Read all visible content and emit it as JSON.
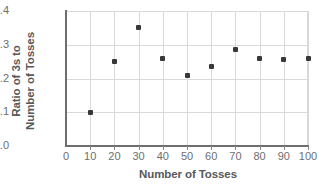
{
  "chart_data": {
    "type": "scatter",
    "title": "",
    "xlabel": "Number of Tosses",
    "ylabel_line1": "Ratio of 3s to",
    "ylabel_line2": "Number of Tosses",
    "x": [
      10,
      20,
      30,
      40,
      50,
      60,
      70,
      80,
      90,
      100
    ],
    "values": [
      0.1,
      0.25,
      0.35,
      0.26,
      0.21,
      0.235,
      0.285,
      0.26,
      0.255,
      0.26
    ],
    "xlim": [
      0,
      100
    ],
    "ylim": [
      0.0,
      0.4
    ],
    "xticks": [
      "0",
      "10",
      "20",
      "30",
      "40",
      "50",
      "60",
      "70",
      "80",
      "90",
      "100"
    ],
    "xtick_values": [
      0,
      10,
      20,
      30,
      40,
      50,
      60,
      70,
      80,
      90,
      100
    ],
    "yticks": [
      "0.0",
      "0.1",
      "0.2",
      "0.3",
      "0.4"
    ],
    "ytick_values": [
      0.0,
      0.1,
      0.2,
      0.3,
      0.4
    ],
    "grid": true,
    "legend": "none",
    "marker_color": "#38383a",
    "grid_color": "#d9d9d9",
    "axis_color": "#6d6e70",
    "label_color": "#58585a"
  }
}
